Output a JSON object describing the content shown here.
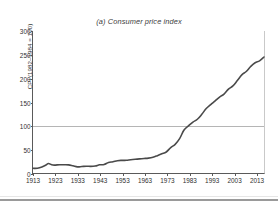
{
  "page": {
    "cut_off_header_text": "",
    "background_color": "#ffffff"
  },
  "figure": {
    "title": "(a) Consumer price index",
    "line_color": "#4a4a4a",
    "gridline_color": "#b5b5b5",
    "axis_color": "#5a5a5a"
  },
  "chart_data": {
    "type": "line",
    "title": "(a) Consumer price index",
    "xlabel": "",
    "ylabel": "CPI (1982–1984 = 100)",
    "xlim": [
      1913,
      2017
    ],
    "ylim": [
      0,
      300
    ],
    "ytick_labels": [
      "0",
      "50",
      "100",
      "150",
      "200",
      "250",
      "300"
    ],
    "ytick_values": [
      0,
      50,
      100,
      150,
      200,
      250,
      300
    ],
    "xtick_labels": [
      "1913",
      "1923",
      "1933",
      "1943",
      "1953",
      "1963",
      "1973",
      "1983",
      "1993",
      "2003",
      "2013"
    ],
    "xtick_values": [
      1913,
      1923,
      1933,
      1943,
      1953,
      1963,
      1973,
      1983,
      1993,
      2003,
      2013
    ],
    "grid": "horizontal reference line at y = 100",
    "reference_line": {
      "value": 100,
      "color": "#b5b5b5"
    },
    "legend": "none",
    "series": [
      {
        "name": "CPI (1982–1984 = 100)",
        "x": [
          1913,
          1915,
          1917,
          1919,
          1920,
          1922,
          1925,
          1927,
          1929,
          1931,
          1933,
          1935,
          1937,
          1939,
          1941,
          1943,
          1945,
          1947,
          1949,
          1951,
          1953,
          1955,
          1957,
          1959,
          1961,
          1963,
          1965,
          1967,
          1969,
          1971,
          1973,
          1975,
          1977,
          1979,
          1981,
          1983,
          1985,
          1987,
          1989,
          1991,
          1993,
          1995,
          1997,
          1999,
          2001,
          2003,
          2005,
          2007,
          2009,
          2011,
          2013,
          2015,
          2017
        ],
        "values": [
          9.9,
          10.1,
          12.8,
          17.3,
          20.0,
          16.8,
          17.5,
          17.4,
          17.1,
          15.2,
          13.0,
          13.7,
          14.4,
          13.9,
          14.7,
          17.3,
          18.0,
          22.3,
          23.8,
          26.0,
          26.7,
          26.8,
          28.1,
          29.1,
          29.9,
          30.6,
          31.5,
          33.4,
          36.7,
          40.5,
          44.4,
          53.8,
          60.6,
          72.6,
          90.9,
          99.6,
          107.6,
          113.6,
          124.0,
          136.2,
          144.5,
          152.4,
          160.5,
          166.6,
          177.1,
          184.0,
          195.3,
          207.3,
          214.5,
          224.9,
          233.0,
          237.0,
          245.1
        ],
        "value_start": 9.9,
        "value_end": 245,
        "color": "#4a4a4a"
      }
    ],
    "notes": [
      "Flat near 10 from 1913 until World War I",
      "Rises to about 20 by 1920 then falls back near 17",
      "Depression trough near 13 around 1933",
      "Steady climb after World War II",
      "Steep inflation through the 1970s",
      "Crosses the 100 reference line around 1983",
      "Flattens briefly around 2009 then resumes rising toward 245"
    ]
  }
}
